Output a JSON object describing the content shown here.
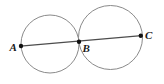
{
  "figure": {
    "canvas": {
      "width": 164,
      "height": 84,
      "background": "#ffffff"
    },
    "style": {
      "circle_stroke": "#8a8a8a",
      "circle_stroke_width": 1,
      "circle_fill": "none",
      "line_stroke": "#4d4d4d",
      "line_stroke_width": 1.2,
      "point_fill": "#111111",
      "point_radius": 2.2,
      "label_color": "#1a1a1a",
      "label_font_size": 11
    },
    "circles": [
      {
        "name": "left-circle",
        "cx": 50,
        "cy": 44,
        "r": 29
      },
      {
        "name": "right-circle",
        "cx": 110.5,
        "cy": 37.5,
        "r": 32
      }
    ],
    "line": {
      "name": "line-ac",
      "x1": 20.5,
      "y1": 46.2,
      "x2": 141.5,
      "y2": 35.6
    },
    "points": [
      {
        "id": "A",
        "label": "A",
        "cx": 21,
        "cy": 46,
        "label_x": 9.5,
        "label_y": 51
      },
      {
        "id": "B",
        "label": "B",
        "cx": 79,
        "cy": 41.8,
        "label_x": 82.5,
        "label_y": 52
      },
      {
        "id": "C",
        "label": "C",
        "cx": 140.8,
        "cy": 35.8,
        "label_x": 145,
        "label_y": 39
      }
    ]
  }
}
